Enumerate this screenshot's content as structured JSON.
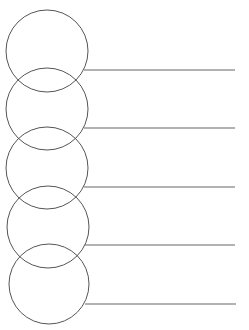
{
  "diagram": {
    "type": "graphic-organizer",
    "stroke_color": "#555555",
    "line_color": "#666666",
    "background": "#ffffff",
    "items": [
      {
        "circle": {
          "cx": 47,
          "cy": 51,
          "r": 41
        },
        "line": {
          "x1": 84,
          "y": 70,
          "x2": 235
        },
        "text": ""
      },
      {
        "circle": {
          "cx": 47,
          "cy": 109,
          "r": 41
        },
        "line": {
          "x1": 84,
          "y": 128,
          "x2": 235
        },
        "text": ""
      },
      {
        "circle": {
          "cx": 47,
          "cy": 168,
          "r": 41
        },
        "line": {
          "x1": 84,
          "y": 187,
          "x2": 235
        },
        "text": ""
      },
      {
        "circle": {
          "cx": 48,
          "cy": 227,
          "r": 41
        },
        "line": {
          "x1": 85,
          "y": 245,
          "x2": 235
        },
        "text": ""
      },
      {
        "circle": {
          "cx": 49,
          "cy": 284,
          "r": 40
        },
        "line": {
          "x1": 85,
          "y": 304,
          "x2": 236
        },
        "text": ""
      }
    ]
  }
}
